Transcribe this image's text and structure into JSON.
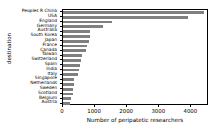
{
  "chart_data": {
    "type": "bar",
    "orientation": "horizontal",
    "title": "",
    "xlabel": "Number of peripatetic researchers",
    "ylabel": "destination",
    "xlim": [
      0,
      4550
    ],
    "xticks": [
      0,
      1000,
      2000,
      3000,
      4000
    ],
    "xtick_labels": [
      "0",
      "1000",
      "2000",
      "3000",
      "4000"
    ],
    "grid": false,
    "legend": null,
    "bar_color": "#808080",
    "categories": [
      "Peoples R China",
      "USA",
      "England",
      "Germany",
      "Australia",
      "South Korea",
      "Japan",
      "France",
      "Canada",
      "Taiwan",
      "Switzerland",
      "Spain",
      "India",
      "Italy",
      "Singapore",
      "Netherlands",
      "Sweden",
      "Scotland",
      "Belgium",
      "Austria"
    ],
    "values": [
      4400,
      3880,
      1530,
      1250,
      850,
      830,
      800,
      740,
      720,
      580,
      570,
      540,
      500,
      470,
      340,
      330,
      310,
      300,
      250,
      230
    ]
  }
}
